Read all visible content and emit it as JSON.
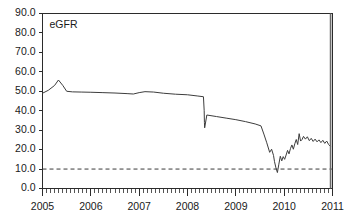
{
  "chart_data": {
    "type": "line",
    "title": "",
    "subtitle": "",
    "xlabel": "",
    "ylabel": "",
    "annotation": "eGFR",
    "grid": false,
    "legend_position": "none",
    "xlim": [
      2005.0,
      2011.0
    ],
    "ylim": [
      0.0,
      90.0
    ],
    "yticks": [
      0.0,
      10.0,
      20.0,
      30.0,
      40.0,
      50.0,
      60.0,
      70.0,
      80.0,
      90.0
    ],
    "ytick_labels": [
      "0.0",
      "10.0",
      "20.0",
      "30.0",
      "40.0",
      "50.0",
      "60.0",
      "70.0",
      "80.0",
      "90.0"
    ],
    "xticks": [
      2005,
      2006,
      2007,
      2008,
      2009,
      2010,
      2011
    ],
    "xtick_labels": [
      "2005",
      "2006",
      "2007",
      "2008",
      "2009",
      "2010",
      "2011"
    ],
    "minor_ticks_per_year": 12,
    "reference_lines": [
      {
        "name": "threshold",
        "axis": "y",
        "value": 10.0,
        "style": "dashed"
      }
    ],
    "vertical_markers": [
      {
        "name": "end-marker",
        "x": 2010.96
      }
    ],
    "series": [
      {
        "name": "eGFR",
        "color": "#3d3d3d",
        "x": [
          2005.0,
          2005.12,
          2005.25,
          2005.33,
          2005.42,
          2005.5,
          2005.62,
          2005.8,
          2006.0,
          2006.25,
          2006.5,
          2006.75,
          2006.88,
          2007.0,
          2007.12,
          2007.3,
          2007.5,
          2007.75,
          2008.0,
          2008.2,
          2008.33,
          2008.345,
          2008.35,
          2008.355,
          2008.4,
          2008.6,
          2008.8,
          2009.0,
          2009.2,
          2009.4,
          2009.52,
          2009.58,
          2009.64,
          2009.7,
          2009.74,
          2009.78,
          2009.8,
          2009.83,
          2009.86,
          2009.89,
          2009.92,
          2009.95,
          2009.98,
          2010.01,
          2010.04,
          2010.07,
          2010.1,
          2010.13,
          2010.16,
          2010.19,
          2010.22,
          2010.25,
          2010.28,
          2010.31,
          2010.34,
          2010.37,
          2010.4,
          2010.44,
          2010.48,
          2010.52,
          2010.56,
          2010.6,
          2010.64,
          2010.68,
          2010.72,
          2010.76,
          2010.8,
          2010.84,
          2010.88,
          2010.92,
          2010.96
        ],
        "y": [
          49.0,
          50.5,
          53.0,
          55.8,
          53.0,
          50.0,
          49.7,
          49.6,
          49.5,
          49.3,
          49.1,
          48.8,
          48.6,
          49.3,
          49.8,
          49.6,
          49.0,
          48.5,
          48.2,
          47.6,
          47.2,
          40.0,
          34.0,
          31.2,
          37.8,
          37.0,
          36.2,
          35.4,
          34.4,
          33.2,
          32.2,
          28.0,
          23.5,
          18.6,
          20.2,
          17.0,
          13.8,
          10.6,
          8.2,
          12.5,
          16.6,
          14.2,
          16.4,
          15.0,
          17.2,
          19.6,
          17.8,
          20.5,
          22.4,
          20.2,
          23.0,
          25.2,
          22.6,
          28.2,
          24.4,
          25.2,
          26.8,
          25.4,
          26.6,
          24.6,
          25.8,
          24.2,
          25.4,
          24.0,
          25.0,
          23.6,
          24.8,
          23.2,
          24.4,
          22.6,
          21.6
        ]
      }
    ]
  }
}
